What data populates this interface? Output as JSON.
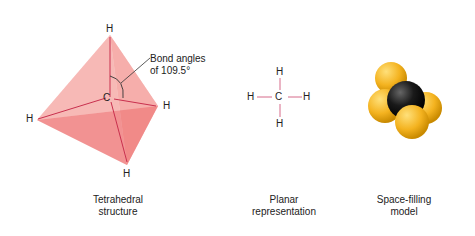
{
  "tetrahedral": {
    "atoms": {
      "top": "H",
      "left": "H",
      "right": "H",
      "bottom": "H",
      "center": "C"
    },
    "annotation_line1": "Bond angles",
    "annotation_line2": "of 109.5°",
    "caption_line1": "Tetrahedral",
    "caption_line2": "structure",
    "face_color": "#f08a8a",
    "bond_color": "#c9304e"
  },
  "planar": {
    "atoms": {
      "top": "H",
      "left": "H",
      "right": "H",
      "bottom": "H",
      "center": "C"
    },
    "caption_line1": "Planar",
    "caption_line2": "representation",
    "bond_color": "#d66b8a"
  },
  "space_filling": {
    "caption_line1": "Space-filling",
    "caption_line2": "model",
    "hydrogen_color": "#f4b320",
    "carbon_color": "#111111"
  }
}
